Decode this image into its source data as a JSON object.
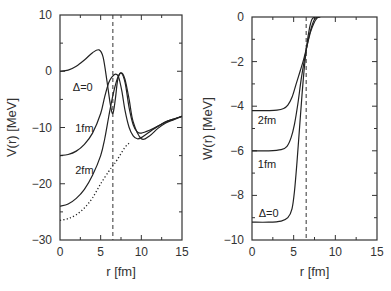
{
  "chart_data": [
    {
      "type": "line",
      "title": "",
      "xlabel": "r [fm]",
      "ylabel": "V(r) [MeV]",
      "xlim": [
        0,
        15
      ],
      "ylim": [
        -30,
        10
      ],
      "xticks": [
        0,
        5,
        10,
        15
      ],
      "yticks": [
        10,
        0,
        -10,
        -20,
        -30
      ],
      "xtick_labels": [
        "0",
        "5",
        "10",
        "15"
      ],
      "ytick_labels": [
        "10",
        "0",
        "−10",
        "−20",
        "−30"
      ],
      "grid": false,
      "vline": {
        "x": 6.5,
        "style": "dashed"
      },
      "series": [
        {
          "name": "Δ=0",
          "style": "solid",
          "x": [
            0,
            1,
            2,
            3,
            4,
            4.8,
            5.3,
            5.8,
            6.2,
            6.5,
            6.8,
            7.1,
            7.5,
            8.0,
            8.5,
            9.0,
            9.5,
            10,
            11,
            12,
            13,
            14,
            15
          ],
          "y": [
            0,
            0.2,
            0.9,
            2.0,
            3.3,
            3.8,
            2.5,
            -2.0,
            -6.0,
            -7.5,
            -5.0,
            -1.5,
            -0.3,
            -2.0,
            -6.5,
            -9.5,
            -10.8,
            -11.0,
            -10.5,
            -9.8,
            -9.0,
            -8.5,
            -8.0
          ]
        },
        {
          "name": "1fm",
          "style": "solid",
          "x": [
            0,
            1,
            2,
            3,
            4,
            5,
            5.5,
            6.0,
            6.4,
            6.8,
            7.2,
            7.6,
            8.0,
            8.5,
            9.0,
            9.5,
            10,
            11,
            12,
            13,
            14,
            15
          ],
          "y": [
            -15,
            -14.8,
            -14.2,
            -13.0,
            -11.0,
            -7.5,
            -4.5,
            -2.0,
            -1.0,
            -0.5,
            -1.0,
            -3.5,
            -7.0,
            -10.0,
            -11.5,
            -12.0,
            -11.8,
            -10.8,
            -9.8,
            -9.0,
            -8.5,
            -8.0
          ]
        },
        {
          "name": "2fm",
          "style": "solid",
          "x": [
            0,
            1,
            2,
            3,
            4,
            5,
            5.5,
            6.0,
            6.4,
            6.8,
            7.2,
            7.6,
            8.0,
            8.5,
            9.0,
            10,
            11,
            12,
            13,
            14,
            15
          ],
          "y": [
            -24,
            -23.6,
            -22.6,
            -21.0,
            -18.5,
            -15.0,
            -12.0,
            -8.0,
            -5.0,
            -2.5,
            -0.8,
            -0.3,
            -1.5,
            -5.0,
            -9.0,
            -12.0,
            -11.5,
            -10.2,
            -9.2,
            -8.6,
            -8.0
          ]
        },
        {
          "name": "bare",
          "style": "dotted",
          "x": [
            0,
            1,
            2,
            3,
            4,
            5,
            6,
            6.5,
            7,
            8,
            8.5
          ],
          "y": [
            -26.5,
            -26.2,
            -25.5,
            -24.3,
            -22.5,
            -20.0,
            -17.8,
            -16.8,
            -15.8,
            -13.5,
            -12.8
          ]
        }
      ],
      "annotations": [
        {
          "text": "Δ=0",
          "x": 2.8,
          "y": -2.8
        },
        {
          "text": "1fm",
          "x": 3.0,
          "y": -10.0
        },
        {
          "text": "2fm",
          "x": 3.0,
          "y": -17.5
        }
      ]
    },
    {
      "type": "line",
      "title": "",
      "xlabel": "r [fm]",
      "ylabel": "W(r) [MeV]",
      "xlim": [
        0,
        15
      ],
      "ylim": [
        -10,
        0
      ],
      "xticks": [
        0,
        5,
        10,
        15
      ],
      "yticks": [
        0,
        -2,
        -4,
        -6,
        -8,
        -10
      ],
      "xtick_labels": [
        "0",
        "5",
        "10",
        "15"
      ],
      "ytick_labels": [
        "0",
        "−2",
        "−4",
        "−6",
        "−8",
        "−10"
      ],
      "grid": false,
      "vline": {
        "x": 6.5,
        "style": "dashed"
      },
      "series": [
        {
          "name": "2fm",
          "style": "solid",
          "x": [
            0,
            2,
            3,
            3.8,
            4.3,
            4.8,
            5.3,
            5.8,
            6.2,
            6.6,
            7.0,
            7.4,
            7.8,
            8.2
          ],
          "y": [
            -4.2,
            -4.2,
            -4.18,
            -4.1,
            -3.95,
            -3.6,
            -3.0,
            -2.4,
            -1.9,
            -1.3,
            -0.7,
            -0.3,
            -0.05,
            0
          ]
        },
        {
          "name": "1fm",
          "style": "solid",
          "x": [
            0,
            2,
            3.5,
            4.2,
            4.7,
            5.1,
            5.5,
            5.9,
            6.3,
            6.7,
            7.1,
            7.5,
            7.9
          ],
          "y": [
            -6.0,
            -6.0,
            -5.95,
            -5.8,
            -5.4,
            -4.8,
            -3.9,
            -2.8,
            -1.9,
            -1.1,
            -0.5,
            -0.1,
            0
          ]
        },
        {
          "name": "Δ=0",
          "style": "solid",
          "x": [
            0,
            2,
            3.5,
            4.3,
            4.8,
            5.1,
            5.4,
            5.7,
            6.0,
            6.3,
            6.6,
            6.9,
            7.2,
            7.6
          ],
          "y": [
            -9.2,
            -9.2,
            -9.15,
            -9.0,
            -8.6,
            -7.8,
            -6.5,
            -5.0,
            -3.5,
            -2.2,
            -1.2,
            -0.5,
            -0.1,
            0
          ]
        }
      ],
      "annotations": [
        {
          "text": "2fm",
          "x": 1.8,
          "y": -4.6
        },
        {
          "text": "1fm",
          "x": 1.8,
          "y": -6.6
        },
        {
          "text": "Δ=0",
          "x": 2.0,
          "y": -8.8
        }
      ]
    }
  ]
}
